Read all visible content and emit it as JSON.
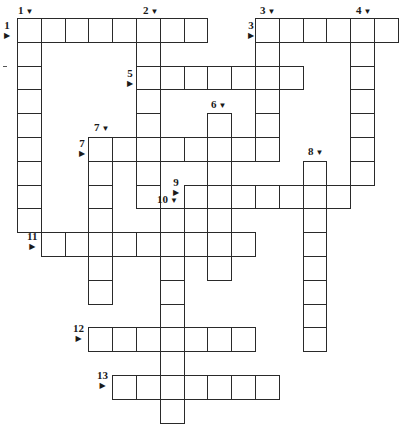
{
  "puzzle": {
    "type": "crossword",
    "cell_size": 23.8,
    "origin_x": 17,
    "origin_y": 18,
    "colors": {
      "border": "#2a2a2a",
      "cell_bg": "#ffffff",
      "text": "#1a1a1a"
    },
    "entries": [
      {
        "number": "1",
        "direction": "across",
        "row": 0,
        "col": 0,
        "length": 8
      },
      {
        "number": "1",
        "direction": "down",
        "row": 0,
        "col": 0,
        "length": 9
      },
      {
        "number": "2",
        "direction": "down",
        "row": 0,
        "col": 5,
        "length": 8
      },
      {
        "number": "3",
        "direction": "across",
        "row": 0,
        "col": 10,
        "length": 6
      },
      {
        "number": "3",
        "direction": "down",
        "row": 0,
        "col": 10,
        "length": 6
      },
      {
        "number": "4",
        "direction": "down",
        "row": 0,
        "col": 14,
        "length": 7
      },
      {
        "number": "5",
        "direction": "across",
        "row": 2,
        "col": 5,
        "length": 7
      },
      {
        "number": "6",
        "direction": "down",
        "row": 4,
        "col": 8,
        "length": 7
      },
      {
        "number": "7",
        "direction": "across",
        "row": 5,
        "col": 3,
        "length": 8
      },
      {
        "number": "7",
        "direction": "down",
        "row": 5,
        "col": 3,
        "length": 7
      },
      {
        "number": "8",
        "direction": "down",
        "row": 6,
        "col": 12,
        "length": 8
      },
      {
        "number": "9",
        "direction": "across",
        "row": 7,
        "col": 7,
        "length": 7
      },
      {
        "number": "10",
        "direction": "down",
        "row": 8,
        "col": 6,
        "length": 9
      },
      {
        "number": "11",
        "direction": "across",
        "row": 9,
        "col": 1,
        "length": 9
      },
      {
        "number": "12",
        "direction": "across",
        "row": 13,
        "col": 3,
        "length": 7
      },
      {
        "number": "13",
        "direction": "across",
        "row": 15,
        "col": 4,
        "length": 7
      }
    ],
    "labels": [
      {
        "text": "1",
        "kind": "down",
        "x": 18,
        "y": 5
      },
      {
        "text": "1",
        "kind": "across",
        "x": 4,
        "y": 20
      },
      {
        "text": "2",
        "kind": "down",
        "x": 143,
        "y": 5
      },
      {
        "text": "3",
        "kind": "down",
        "x": 260,
        "y": 5
      },
      {
        "text": "3",
        "kind": "across",
        "x": 248,
        "y": 20
      },
      {
        "text": "4",
        "kind": "down",
        "x": 356,
        "y": 5
      },
      {
        "text": "5",
        "kind": "across",
        "x": 127,
        "y": 68
      },
      {
        "text": "6",
        "kind": "down",
        "x": 211,
        "y": 99
      },
      {
        "text": "7",
        "kind": "down",
        "x": 94,
        "y": 122
      },
      {
        "text": "7",
        "kind": "across",
        "x": 79,
        "y": 138
      },
      {
        "text": "8",
        "kind": "down",
        "x": 308,
        "y": 146
      },
      {
        "text": "9",
        "kind": "across",
        "x": 173,
        "y": 177
      },
      {
        "text": "10",
        "kind": "down",
        "x": 163,
        "y": 194,
        "offset_left": true
      },
      {
        "text": "11",
        "kind": "across",
        "x": 27,
        "y": 231
      },
      {
        "text": "12",
        "kind": "across",
        "x": 73,
        "y": 323
      },
      {
        "text": "13",
        "kind": "across",
        "x": 97,
        "y": 370
      }
    ]
  }
}
